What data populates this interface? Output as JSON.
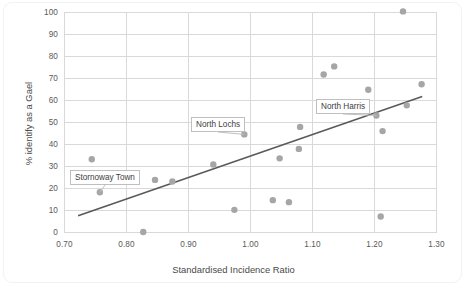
{
  "chart_data": {
    "type": "scatter",
    "title": "",
    "xlabel": "Standardised Incidence Ratio",
    "ylabel": "% identify as a Gael",
    "xlim": [
      0.7,
      1.3
    ],
    "ylim": [
      0,
      100
    ],
    "xticks": [
      "0.70",
      "0.80",
      "0.90",
      "1.00",
      "1.10",
      "1.20",
      "1.30"
    ],
    "xtick_values": [
      0.7,
      0.8,
      0.9,
      1.0,
      1.1,
      1.2,
      1.3
    ],
    "yticks": [
      "0",
      "10",
      "20",
      "30",
      "40",
      "50",
      "60",
      "70",
      "80",
      "90",
      "100"
    ],
    "ytick_values": [
      0,
      10,
      20,
      30,
      40,
      50,
      60,
      70,
      80,
      90,
      100
    ],
    "grid": true,
    "legend": "none",
    "marker_color": "#a6a6a6",
    "trendline_color": "#595959",
    "gridline_color": "#d9d9d9",
    "points": [
      {
        "x": 0.744,
        "y": 33.3,
        "label": ""
      },
      {
        "x": 0.757,
        "y": 18.3,
        "label": "Stornoway Town"
      },
      {
        "x": 0.827,
        "y": 0.2,
        "label": ""
      },
      {
        "x": 0.846,
        "y": 23.9,
        "label": ""
      },
      {
        "x": 0.874,
        "y": 23.2,
        "label": ""
      },
      {
        "x": 0.94,
        "y": 30.9,
        "label": ""
      },
      {
        "x": 0.974,
        "y": 10.3,
        "label": ""
      },
      {
        "x": 0.99,
        "y": 44.6,
        "label": "North Lochs"
      },
      {
        "x": 1.036,
        "y": 14.7,
        "label": ""
      },
      {
        "x": 1.047,
        "y": 33.7,
        "label": ""
      },
      {
        "x": 1.062,
        "y": 13.8,
        "label": ""
      },
      {
        "x": 1.078,
        "y": 38.0,
        "label": ""
      },
      {
        "x": 1.08,
        "y": 48.0,
        "label": ""
      },
      {
        "x": 1.118,
        "y": 71.8,
        "label": ""
      },
      {
        "x": 1.135,
        "y": 75.5,
        "label": ""
      },
      {
        "x": 1.19,
        "y": 64.9,
        "label": ""
      },
      {
        "x": 1.203,
        "y": 53.2,
        "label": "North Harris"
      },
      {
        "x": 1.21,
        "y": 7.3,
        "label": ""
      },
      {
        "x": 1.213,
        "y": 46.1,
        "label": ""
      },
      {
        "x": 1.246,
        "y": 100.5,
        "label": ""
      },
      {
        "x": 1.252,
        "y": 57.8,
        "label": ""
      },
      {
        "x": 1.276,
        "y": 67.4,
        "label": ""
      }
    ],
    "trendline": {
      "x0": 0.722,
      "y0": 7.6,
      "x1": 1.277,
      "y1": 61.8
    },
    "annotations": [
      {
        "name": "stornoway-town",
        "text": "Stornoway Town",
        "box_x": 70,
        "box_y": 170,
        "point_x": 0.757,
        "point_y": 18.3
      },
      {
        "name": "north-lochs",
        "text": "North Lochs",
        "box_x": 191,
        "box_y": 117,
        "point_x": 0.99,
        "point_y": 44.6
      },
      {
        "name": "north-harris",
        "text": "North Harris",
        "box_x": 316,
        "box_y": 99,
        "point_x": 1.203,
        "point_y": 53.2
      }
    ]
  }
}
